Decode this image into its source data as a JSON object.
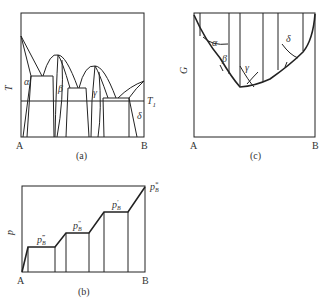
{
  "panels": {
    "a": {
      "caption": "(a)",
      "y_axis_label": "T",
      "x_left": "A",
      "x_right": "B",
      "isotherm_label": "T",
      "isotherm_sub": "1",
      "phases": [
        "α",
        "β",
        "γ",
        "δ"
      ]
    },
    "b": {
      "caption": "(b)",
      "y_axis_label": "p",
      "x_left": "A",
      "x_right": "B",
      "pressure_labels": [
        {
          "base": "p",
          "sub": "B",
          "sup": "‴"
        },
        {
          "base": "p",
          "sub": "B",
          "sup": "″"
        },
        {
          "base": "p",
          "sub": "B",
          "sup": "′"
        },
        {
          "base": "p",
          "sub": "B",
          "sup": "*"
        }
      ]
    },
    "c": {
      "caption": "(c)",
      "y_axis_label": "G",
      "x_left": "A",
      "x_right": "B",
      "phases": [
        "α",
        "β",
        "γ",
        "δ"
      ]
    }
  }
}
